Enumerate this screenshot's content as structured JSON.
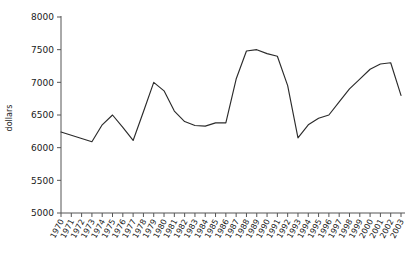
{
  "chart_data": {
    "type": "line",
    "title": "",
    "xlabel": "",
    "ylabel": "dollars",
    "ylim": [
      5000,
      8000
    ],
    "xlim": [
      1970,
      2003
    ],
    "grid": false,
    "legend": false,
    "legend_position": "none",
    "yticks": [
      5000,
      5500,
      6000,
      6500,
      7000,
      7500,
      8000
    ],
    "ytick_labels": [
      "5000",
      "5500",
      "6000",
      "6500",
      "7000",
      "7500",
      "8000"
    ],
    "x": [
      1970,
      1971,
      1972,
      1973,
      1974,
      1975,
      1976,
      1977,
      1978,
      1979,
      1980,
      1981,
      1982,
      1983,
      1984,
      1985,
      1986,
      1987,
      1988,
      1989,
      1990,
      1991,
      1992,
      1993,
      1994,
      1995,
      1996,
      1997,
      1998,
      1999,
      2000,
      2001,
      2002,
      2003
    ],
    "xtick_labels": [
      "1970",
      "1971",
      "1972",
      "1973",
      "1974",
      "1975",
      "1976",
      "1977",
      "1978",
      "1979",
      "1980",
      "1981",
      "1982",
      "1983",
      "1984",
      "1985",
      "1986",
      "1987",
      "1988",
      "1989",
      "1990",
      "1991",
      "1992",
      "1993",
      "1994",
      "1995",
      "1996",
      "1997",
      "1998",
      "1999",
      "2000",
      "2001",
      "2002",
      "2003"
    ],
    "series": [
      {
        "name": "dollars",
        "color": "#2b2b2b",
        "values": [
          6240,
          6190,
          6140,
          6090,
          6350,
          6500,
          6310,
          6110,
          6550,
          7000,
          6870,
          6560,
          6400,
          6340,
          6330,
          6380,
          6380,
          7050,
          7480,
          7500,
          7440,
          7400,
          6950,
          6150,
          6350,
          6450,
          6500,
          6700,
          6900,
          7050,
          7200,
          7280,
          7300,
          6800
        ]
      }
    ]
  }
}
